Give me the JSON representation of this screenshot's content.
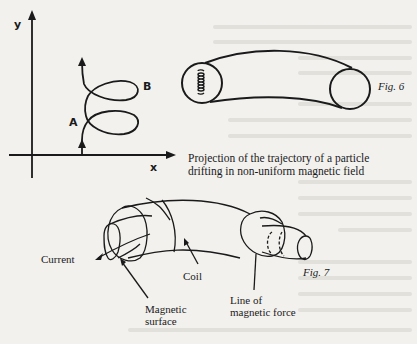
{
  "figure5": {
    "axis_x_label": "x",
    "axis_y_label": "y",
    "point_a_label": "A",
    "point_b_label": "B",
    "caption_line1": "Projection of the trajectory of a particle",
    "caption_line2": "drifting in non-uniform magnetic field"
  },
  "figure6": {
    "label": "Fig. 6"
  },
  "figure7": {
    "label": "Fig. 7",
    "annotations": {
      "current": "Current",
      "coil": "Coil",
      "magnetic_surface_line1": "Magnetic",
      "magnetic_surface_line2": "surface",
      "line_of_force_line1": "Line of",
      "line_of_force_line2": "magnetic force"
    }
  },
  "colors": {
    "paper": "#f2f1ee",
    "ink": "#1a1a1a",
    "bleed_text": "#dcdad5"
  }
}
